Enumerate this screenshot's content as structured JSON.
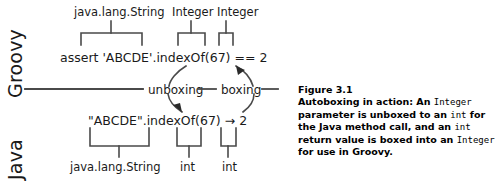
{
  "figure": {
    "background": "#ffffff",
    "ink": "#1a1a1a"
  },
  "lanes": [
    {
      "id": "groovy",
      "label": "Groovy"
    },
    {
      "id": "java",
      "label": "Java"
    }
  ],
  "groovy": {
    "code": "assert 'ABCDE'.indexOf(67) == 2",
    "annotations": [
      {
        "name": "java.lang.String",
        "label": "java.lang.String"
      },
      {
        "name": "integer-arg",
        "label": "Integer"
      },
      {
        "name": "integer-result",
        "label": "Integer"
      }
    ]
  },
  "java": {
    "code": "\"ABCDE\".indexOf(67)",
    "arrow_glyph": "→",
    "result": "2",
    "annotations": [
      {
        "name": "java.lang.String",
        "label": "java.lang.String"
      },
      {
        "name": "int-arg",
        "label": "int"
      },
      {
        "name": "int-result",
        "label": "int"
      }
    ]
  },
  "flow": {
    "unboxing_label": "unboxing",
    "boxing_label": "boxing"
  },
  "caption": {
    "title": "Figure 3.1",
    "line1_a": "Autoboxing in action: An ",
    "line1_mono": "Integer",
    "line2_a": "parameter is unboxed to an ",
    "line2_mono": "int",
    "line2_b": " for",
    "line3_a": "the Java method call, and an ",
    "line3_mono": "int",
    "line3_b": " return",
    "line4_a": "value is boxed into an ",
    "line4_mono": "Integer",
    "line4_b": " for use",
    "line5": "in Groovy."
  }
}
